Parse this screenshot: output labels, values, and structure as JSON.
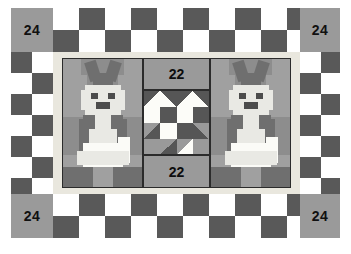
{
  "diagram": {
    "type": "quilt-layout",
    "canvas": {
      "width": 351,
      "height": 254,
      "background": "#ffffff"
    },
    "colors": {
      "background": "#ffffff",
      "corner_fill": "#9a9a9a",
      "checker_dark": "#595959",
      "checker_light": "#ffffff",
      "sashing": "#e9e7de",
      "block_background": "#9a9a9a",
      "bunny_background": "#8d8d8d",
      "bunny_mid": "#a0a0a0",
      "bunny_dark": "#6f6f6f",
      "bunny_light": "#e9e9e4",
      "bunny_white": "#fbfbf7",
      "eye_dark": "#4c4c4c",
      "heart_dark": "#565656",
      "heart_white": "#fcfcf8",
      "outline": "#2b2b2b",
      "label_text": "#101010"
    },
    "corner_blocks": [
      {
        "position": "top-left",
        "label": "24"
      },
      {
        "position": "top-right",
        "label": "24"
      },
      {
        "position": "bottom-left",
        "label": "24"
      },
      {
        "position": "bottom-right",
        "label": "24"
      }
    ],
    "center_column": [
      {
        "position": "top",
        "label": "22",
        "kind": "plain-block"
      },
      {
        "position": "middle",
        "label": "",
        "kind": "heart-block"
      },
      {
        "position": "bottom",
        "label": "22",
        "kind": "plain-block"
      }
    ],
    "bunny_blocks": [
      {
        "position": "left",
        "motif": "bunny"
      },
      {
        "position": "right",
        "motif": "bunny"
      }
    ],
    "border": {
      "style": "two-row checkerboard",
      "rows": 2,
      "top_columns": 12,
      "side_rows": 7
    }
  }
}
